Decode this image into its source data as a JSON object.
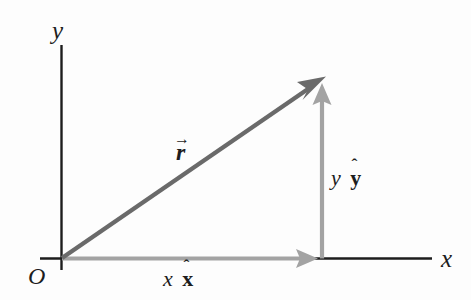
{
  "figure": {
    "kind": "vector-decomposition-diagram",
    "width": 471,
    "height": 300,
    "background_color": "#fdfdfd"
  },
  "colors": {
    "axis": "#1d1d1d",
    "text": "#1d1d1d",
    "resultant_vector": "#6a6a6a",
    "component_vector": "#a3a3a3"
  },
  "axes": {
    "origin_label": "O",
    "y_axis_label": "y",
    "x_axis_label": "x",
    "origin_point": {
      "x": 62,
      "y": 258
    },
    "y_axis": {
      "x": 61,
      "y_top": 45,
      "y_bottom": 270
    },
    "x_axis": {
      "y": 258,
      "x_left": 40,
      "x_right": 432
    }
  },
  "vectors": {
    "resultant": {
      "symbol": "r",
      "accent": "→",
      "label_text": "r",
      "color": "#6a6a6a",
      "from": {
        "x": 62,
        "y": 258
      },
      "to": {
        "x": 325,
        "y": 77
      },
      "label_position": {
        "x": 176,
        "y": 140
      }
    },
    "x_component": {
      "scalar": "x",
      "unit_vector": "x",
      "accent": "ˆ",
      "color": "#a3a3a3",
      "from": {
        "x": 62,
        "y": 258
      },
      "to": {
        "x": 318,
        "y": 258
      },
      "label_position": {
        "x": 163,
        "y": 269
      }
    },
    "y_component": {
      "scalar": "y",
      "unit_vector": "y",
      "accent": "ˆ",
      "color": "#a3a3a3",
      "from": {
        "x": 322,
        "y": 258
      },
      "to": {
        "x": 322,
        "y": 84
      },
      "label_position": {
        "x": 331,
        "y": 168
      }
    }
  }
}
